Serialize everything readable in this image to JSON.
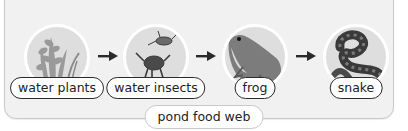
{
  "diagram": {
    "title": "pond food web",
    "type": "food-chain",
    "nodes": [
      {
        "label": "water plants",
        "icon": "water-plants-icon"
      },
      {
        "label": "water insects",
        "icon": "water-insects-icon"
      },
      {
        "label": "frog",
        "icon": "frog-icon"
      },
      {
        "label": "snake",
        "icon": "snake-icon"
      }
    ],
    "edges": [
      {
        "from": "water plants",
        "to": "water insects"
      },
      {
        "from": "water insects",
        "to": "frog"
      },
      {
        "from": "frog",
        "to": "snake"
      }
    ]
  }
}
